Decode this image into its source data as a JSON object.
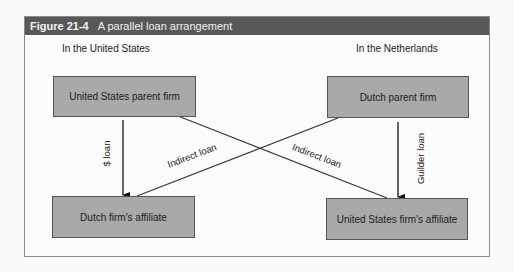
{
  "figure": {
    "number": "Figure 21-4",
    "title": "A parallel loan arrangement"
  },
  "regions": {
    "left": "In the United States",
    "right": "In the Netherlands"
  },
  "boxes": {
    "us_parent": "United States parent firm",
    "dutch_parent": "Dutch parent firm",
    "dutch_affiliate": "Dutch firm's affiliate",
    "us_affiliate": "United States firm's affiliate"
  },
  "arrows": {
    "dollar_loan": "$ loan",
    "guilder_loan": "Guilder loan",
    "indirect_left": "Indirect loan",
    "indirect_right": "Indirect loan"
  },
  "colors": {
    "header_bg": "#585858",
    "box_fill": "#a9a9a9"
  }
}
